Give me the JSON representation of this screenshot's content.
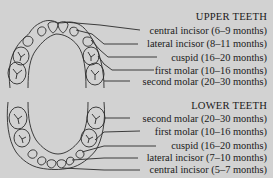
{
  "upper": {
    "title": "UPPER TEETH",
    "teeth": [
      {
        "name": "central incisor",
        "age": "(6–9 months)",
        "label": "central incisor (6–9 months)"
      },
      {
        "name": "lateral incisor",
        "age": "(8–11 months)",
        "label": "lateral incisor (8–11 months)"
      },
      {
        "name": "cuspid",
        "age": "(16–20 months)",
        "label": "cuspid (16–20 months)"
      },
      {
        "name": "first molar",
        "age": "(10–16 months)",
        "label": "first molar (10–16 months)"
      },
      {
        "name": "second molar",
        "age": "(20–30 months)",
        "label": "second molar (20–30 months)"
      }
    ]
  },
  "lower": {
    "title": "LOWER TEETH",
    "teeth": [
      {
        "name": "second molar",
        "age": "(20–30 months)",
        "label": "second molar (20–30 months)"
      },
      {
        "name": "first molar",
        "age": "(10–16 months)",
        "label": "first molar (10–16 months)"
      },
      {
        "name": "cuspid",
        "age": "(16–20 months)",
        "label": "cuspid (16–20 months)"
      },
      {
        "name": "lateral incisor",
        "age": "(7–10 months)",
        "label": "lateral incisor (7–10 months)"
      },
      {
        "name": "central incisor",
        "age": "(5–7 months)",
        "label": "central incisor (5–7 months)"
      }
    ]
  },
  "colors": {
    "background": "#d2d2d2",
    "ink": "#1a1a1a"
  }
}
